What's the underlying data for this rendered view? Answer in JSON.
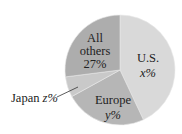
{
  "chart_data": {
    "type": "pie",
    "title": "",
    "start": "12 o'clock",
    "direction": "clockwise",
    "slices": [
      {
        "name": "U.S.",
        "label_line1": "U.S.",
        "label_value": "x%",
        "value_symbol": "x",
        "value": 43,
        "value_note": "estimated from slice angle",
        "color": "#d9d9d9"
      },
      {
        "name": "Europe",
        "label_line1": "Europe",
        "label_value": "y%",
        "value_symbol": "y",
        "value": 24,
        "value_note": "estimated from slice angle",
        "color": "#b6b6b6"
      },
      {
        "name": "Japan",
        "label_line1": "Japan",
        "label_value": "z%",
        "value_symbol": "z",
        "value": 6,
        "value_note": "estimated from slice angle",
        "color": "#c9c9c9"
      },
      {
        "name": "All others",
        "label_line1": "All",
        "label_line2": "others",
        "label_value": "27%",
        "value": 27,
        "color": "#adadad"
      }
    ],
    "legend": "none",
    "annotations": [
      "Japan label outside slice with leader line"
    ]
  }
}
